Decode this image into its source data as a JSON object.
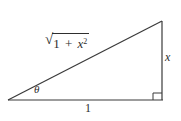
{
  "figure": {
    "colors": {
      "line": "#3a3a3a",
      "background": "#ffffff"
    },
    "labels": {
      "hypotenuse": {
        "radical": "√",
        "body": "1 + ",
        "variable": "x",
        "exponent": "2"
      },
      "angle": "θ",
      "opposite_side": "x",
      "base_side": "1"
    }
  }
}
